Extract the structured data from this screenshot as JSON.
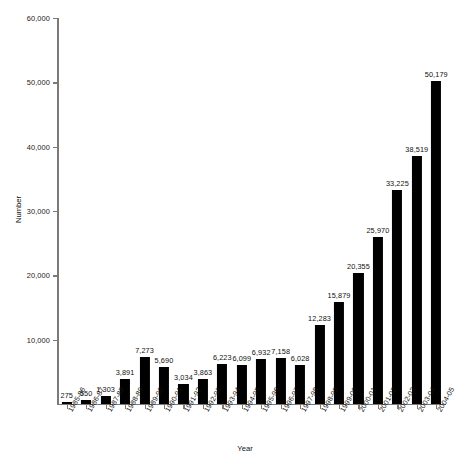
{
  "chart_data": {
    "type": "bar",
    "title": "",
    "xlabel": "Year",
    "ylabel": "Number",
    "ylim": [
      0,
      60000
    ],
    "ytick_labels": [
      "60,000",
      "50,000",
      "40,000",
      "30,000",
      "20,000",
      "10,000",
      ""
    ],
    "ytick_values": [
      60000,
      50000,
      40000,
      30000,
      20000,
      10000,
      0
    ],
    "grid": false,
    "legend": false,
    "bar_color": "#000000",
    "axis_color": "#7a7a7a",
    "categories": [
      "1985-86",
      "1986-87",
      "1987-88",
      "1988-89",
      "1989-90",
      "1990-91",
      "1991-92",
      "1992-93",
      "1993-94",
      "1994-95",
      "1995-96",
      "1996-97",
      "1997-98",
      "1998-99",
      "1999-00",
      "2000-01",
      "2001-02",
      "2002-03",
      "2003-04",
      "2004-05"
    ],
    "values": [
      275,
      550,
      1303,
      3891,
      7273,
      5690,
      3034,
      3863,
      6223,
      6099,
      6932,
      7158,
      6028,
      12283,
      15879,
      20355,
      25970,
      33225,
      38519,
      50179
    ],
    "value_labels": [
      "275",
      "550",
      "1,303",
      "3,891",
      "7,273",
      "5,690",
      "3,034",
      "3,863",
      "6,223",
      "6,099",
      "6,932",
      "7,158",
      "6,028",
      "12,283",
      "15,879",
      "20,355",
      "25,970",
      "33,225",
      "38,519",
      "50,179"
    ]
  }
}
